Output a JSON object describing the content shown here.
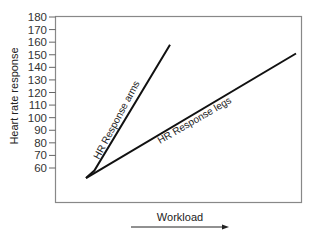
{
  "chart_data": {
    "type": "line",
    "title": "",
    "xlabel": "Workload",
    "ylabel": "Heart rate response",
    "x_axis": {
      "ticks": [],
      "arrow": "right",
      "note": "Workload increases to the right (no numeric ticks)"
    },
    "y_axis": {
      "ticks": [
        60,
        70,
        80,
        90,
        100,
        110,
        120,
        130,
        140,
        150,
        160,
        170,
        180
      ],
      "tick_labels": [
        "60",
        "70",
        "80",
        "90",
        "100",
        "110",
        "120",
        "130",
        "140",
        "150",
        "160",
        "170",
        "180"
      ],
      "ylim": [
        50,
        180
      ]
    },
    "grid": false,
    "legend": null,
    "series": [
      {
        "name": "HR Response arms",
        "label": "HR Response arms",
        "points": [
          {
            "x": 0.0,
            "y": 52
          },
          {
            "x": 0.04,
            "y": 58
          },
          {
            "x": 0.4,
            "y": 158
          }
        ]
      },
      {
        "name": "HR Response legs",
        "label": "HR Response legs",
        "points": [
          {
            "x": 0.0,
            "y": 52
          },
          {
            "x": 1.0,
            "y": 151
          }
        ]
      }
    ],
    "annotations": [
      "HR Response arms",
      "HR Response legs"
    ]
  }
}
